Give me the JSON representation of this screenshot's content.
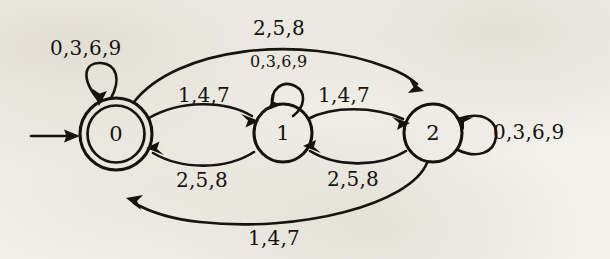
{
  "diagram": {
    "background_color": "#f3f1ec",
    "ink_color": "#16120d",
    "states": [
      {
        "id": "s0",
        "label": "0",
        "accepting": true,
        "start": true,
        "cx": 116,
        "cy": 134,
        "r": 36
      },
      {
        "id": "s1",
        "label": "1",
        "accepting": false,
        "start": false,
        "cx": 283,
        "cy": 133,
        "r": 29
      },
      {
        "id": "s2",
        "label": "2",
        "accepting": false,
        "start": false,
        "cx": 433,
        "cy": 133,
        "r": 29
      }
    ],
    "labels": {
      "self_loop_0": "0,3,6,9",
      "self_loop_1": "0,3,6,9",
      "self_loop_2": "0,3,6,9",
      "top_arc_0_to_2": "2,5,8",
      "edge_0_to_1": "1,4,7",
      "edge_1_to_0": "2,5,8",
      "edge_1_to_2": "1,4,7",
      "edge_2_to_1": "2,5,8",
      "bottom_arc_2_to_0": "1,4,7"
    },
    "transitions": [
      {
        "from": "0",
        "to": "0",
        "symbols": "0,3,6,9",
        "kind": "self-loop-top"
      },
      {
        "from": "0",
        "to": "1",
        "symbols": "1,4,7",
        "kind": "arc-upper"
      },
      {
        "from": "1",
        "to": "0",
        "symbols": "2,5,8",
        "kind": "arc-lower"
      },
      {
        "from": "0",
        "to": "2",
        "symbols": "2,5,8",
        "kind": "arc-top-long"
      },
      {
        "from": "1",
        "to": "1",
        "symbols": "0,3,6,9",
        "kind": "self-loop-top"
      },
      {
        "from": "1",
        "to": "2",
        "symbols": "1,4,7",
        "kind": "arc-upper"
      },
      {
        "from": "2",
        "to": "1",
        "symbols": "2,5,8",
        "kind": "arc-lower"
      },
      {
        "from": "2",
        "to": "2",
        "symbols": "0,3,6,9",
        "kind": "self-loop-right"
      },
      {
        "from": "2",
        "to": "0",
        "symbols": "1,4,7",
        "kind": "arc-bottom-long"
      }
    ]
  }
}
